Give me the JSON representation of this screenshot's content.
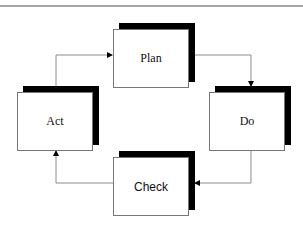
{
  "diagram": {
    "type": "cycle",
    "title": "",
    "nodes": [
      {
        "id": "plan",
        "label": "Plan",
        "x": 113,
        "y": 29
      },
      {
        "id": "do",
        "label": "Do",
        "x": 209,
        "y": 92
      },
      {
        "id": "check",
        "label": "Check",
        "x": 113,
        "y": 157
      },
      {
        "id": "act",
        "label": "Act",
        "x": 17,
        "y": 92
      }
    ],
    "edges": [
      {
        "from": "act",
        "to": "plan"
      },
      {
        "from": "plan",
        "to": "do"
      },
      {
        "from": "do",
        "to": "check"
      },
      {
        "from": "check",
        "to": "act"
      }
    ],
    "colors": {
      "connector": "#8c8c8c",
      "arrowhead": "#000000",
      "shadow": "#000000",
      "box_border": "#777777",
      "top_rule": "#a6a6a6"
    }
  }
}
